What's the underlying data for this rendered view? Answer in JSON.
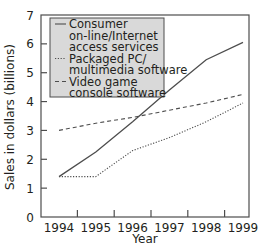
{
  "chart_data": {
    "type": "line",
    "title": "",
    "xlabel": "Year",
    "ylabel": "Sales in dollars (billions)",
    "x": [
      1994,
      1995,
      1996,
      1997,
      1998,
      1999
    ],
    "categories": [
      "1994",
      "1995",
      "1996",
      "1997",
      "1998",
      "1999"
    ],
    "ylim": [
      0,
      7
    ],
    "yticks": [
      0,
      1,
      2,
      3,
      4,
      5,
      6,
      7
    ],
    "grid": false,
    "legend_position": "upper left (inside, shaded box)",
    "series": [
      {
        "name": "Consumer on-line/Internet access services",
        "legend_lines": [
          "Consumer",
          "on-line/Internet",
          "access services"
        ],
        "style": "solid",
        "values": [
          1.4,
          2.25,
          3.3,
          4.4,
          5.45,
          6.05
        ]
      },
      {
        "name": "Packaged PC/ multimedia software",
        "legend_lines": [
          "Packaged PC/",
          "multimedia software"
        ],
        "style": "dotted",
        "values": [
          1.4,
          1.4,
          2.3,
          2.75,
          3.3,
          3.95
        ]
      },
      {
        "name": "Video game console software",
        "legend_lines": [
          "Video game",
          "console software"
        ],
        "style": "dashed",
        "values": [
          3.0,
          3.25,
          3.45,
          3.7,
          3.95,
          4.25
        ]
      }
    ]
  },
  "colors": {
    "line": "#4d4d4d",
    "axis": "#4d4d4d",
    "legend_bg": "#d9d9d9",
    "text": "#231f20"
  }
}
